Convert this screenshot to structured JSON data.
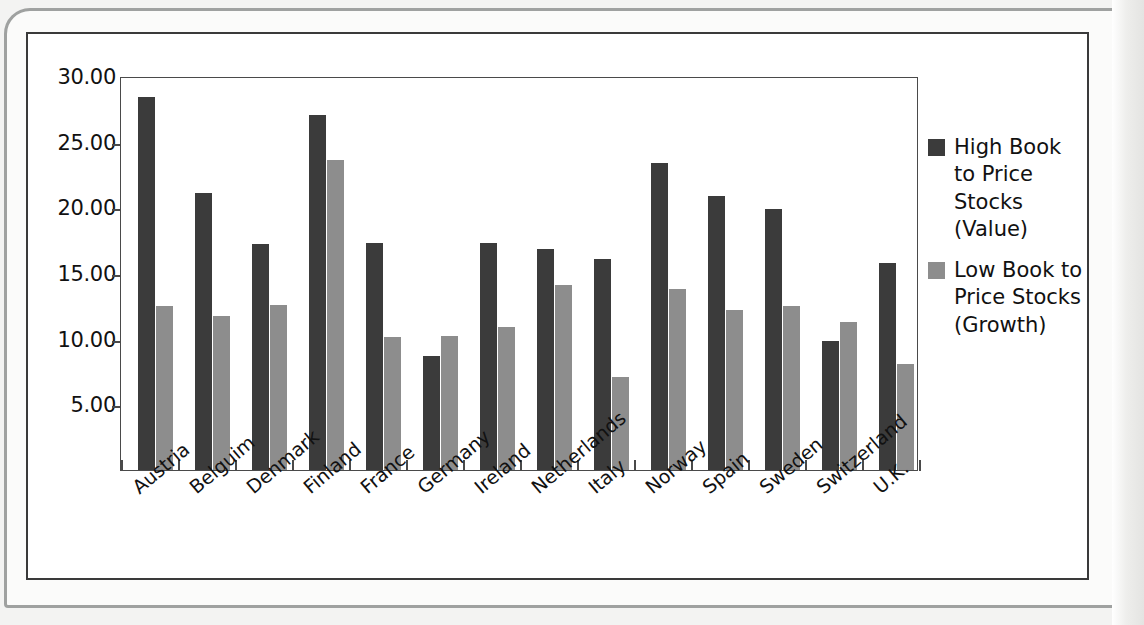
{
  "chart_data": {
    "type": "bar",
    "title": "",
    "xlabel": "",
    "ylabel": "",
    "ylim": [
      0,
      30
    ],
    "yticks": [
      "5.00",
      "10.00",
      "15.00",
      "20.00",
      "25.00",
      "30.00"
    ],
    "ytick_values": [
      5,
      10,
      15,
      20,
      25,
      30
    ],
    "grid": false,
    "legend_position": "right",
    "categories": [
      "Austria",
      "Belguim",
      "Denmark",
      "Finland",
      "France",
      "Germany",
      "Ireland",
      "Netherlands",
      "Italy",
      "Norway",
      "Spain",
      "Sweden",
      "Switzerland",
      "U.K."
    ],
    "series": [
      {
        "name": "High Book to Price Stocks (Value)",
        "color": "#3b3b3b",
        "values": [
          28.4,
          21.1,
          17.2,
          27.0,
          17.3,
          8.7,
          17.3,
          16.8,
          16.1,
          23.4,
          20.9,
          19.9,
          9.8,
          15.8
        ]
      },
      {
        "name": "Low Book to Price Stocks (Growth)",
        "color": "#8d8d8d",
        "values": [
          12.5,
          11.7,
          12.6,
          23.6,
          10.1,
          10.2,
          10.9,
          14.1,
          7.1,
          13.8,
          12.2,
          12.5,
          11.3,
          8.1
        ]
      }
    ]
  },
  "legend": {
    "entries": [
      {
        "label": "High Book to Price Stocks (Value)",
        "swatch": "dark-swatch"
      },
      {
        "label": "Low Book to Price Stocks (Growth)",
        "swatch": "gray-swatch"
      }
    ]
  },
  "colors": {
    "value_series": "#3b3b3b",
    "growth_series": "#8d8d8d",
    "axis": "#4a4a4a",
    "page_background": "#f3f3f2",
    "figure_background": "#ffffff"
  }
}
